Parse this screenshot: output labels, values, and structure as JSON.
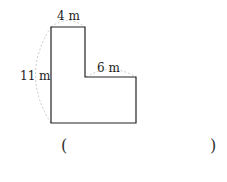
{
  "figure": {
    "shape": "L-shaped polygon",
    "labels": {
      "top_width": "4 m",
      "step_width": "6 m",
      "height": "11 m"
    }
  },
  "answer": {
    "open_paren": "(",
    "close_paren": ")",
    "value": ""
  }
}
